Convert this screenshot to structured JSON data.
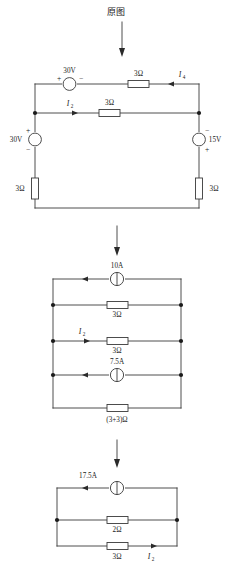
{
  "page": {
    "title": "原图",
    "width": 233,
    "height": 566,
    "background": "#ffffff",
    "ink_color": "#3a3a3a"
  },
  "flow_arrows": [
    {
      "name": "arrow-original-to-step1",
      "from_figure": "original",
      "to_figure": "step1"
    },
    {
      "name": "arrow-step1-to-step2",
      "from_figure": "step1",
      "to_figure": "step2"
    }
  ],
  "figures": [
    {
      "id": "original",
      "caption": "原图",
      "caption_position": "above",
      "components": [
        {
          "name": "source-30v-top",
          "type": "voltage-source",
          "label": "30V",
          "plus": "left",
          "minus": "right",
          "orientation": "horizontal"
        },
        {
          "name": "resistor-3ohm-top-right",
          "type": "resistor",
          "label": "3Ω",
          "orientation": "horizontal"
        },
        {
          "name": "resistor-3ohm-middle",
          "type": "resistor",
          "label": "3Ω",
          "orientation": "horizontal"
        },
        {
          "name": "source-30v-left",
          "type": "voltage-source",
          "label": "30V",
          "plus": "top",
          "minus": "bottom",
          "orientation": "vertical"
        },
        {
          "name": "source-15v-right",
          "type": "voltage-source",
          "label": "15V",
          "plus": "bottom",
          "minus": "top",
          "orientation": "vertical"
        },
        {
          "name": "resistor-3ohm-bottom-left",
          "type": "resistor",
          "label": "3Ω",
          "orientation": "vertical"
        },
        {
          "name": "resistor-3ohm-bottom-right",
          "type": "resistor",
          "label": "3Ω",
          "orientation": "vertical"
        }
      ],
      "currents": [
        {
          "name": "current-I4",
          "symbol": "I",
          "subscript": "4",
          "direction": "left"
        },
        {
          "name": "current-I2",
          "symbol": "I",
          "subscript": "2",
          "direction": "right"
        }
      ]
    },
    {
      "id": "step1",
      "caption": "(3+3)Ω",
      "caption_position": "below",
      "components": [
        {
          "name": "source-10a",
          "type": "current-source",
          "label": "10A",
          "direction": "left",
          "orientation": "horizontal"
        },
        {
          "name": "resistor-3ohm-branch2",
          "type": "resistor",
          "label": "3Ω",
          "orientation": "horizontal"
        },
        {
          "name": "resistor-3ohm-branch3",
          "type": "resistor",
          "label": "3Ω",
          "orientation": "horizontal"
        },
        {
          "name": "source-7p5a",
          "type": "current-source",
          "label": "7.5A",
          "direction": "left",
          "orientation": "horizontal"
        },
        {
          "name": "resistor-3plus3ohm-bottom",
          "type": "resistor",
          "label": "(3+3)Ω",
          "orientation": "horizontal"
        }
      ],
      "currents": [
        {
          "name": "current-I2",
          "symbol": "I",
          "subscript": "2",
          "direction": "right"
        }
      ]
    },
    {
      "id": "step2",
      "caption": "",
      "caption_position": "none",
      "components": [
        {
          "name": "source-17p5a",
          "type": "current-source",
          "label": "17.5A",
          "direction": "left",
          "orientation": "horizontal"
        },
        {
          "name": "resistor-2ohm",
          "type": "resistor",
          "label": "2Ω",
          "orientation": "horizontal"
        },
        {
          "name": "resistor-3ohm-bottom",
          "type": "resistor",
          "label": "3Ω",
          "orientation": "horizontal"
        }
      ],
      "currents": [
        {
          "name": "current-I2",
          "symbol": "I",
          "subscript": "2",
          "direction": "right"
        }
      ]
    }
  ],
  "labels": {
    "title": "原图",
    "v30_top": "30V",
    "v30_left": "30V",
    "v15_right": "15V",
    "r3_top_right": "3Ω",
    "r3_middle": "3Ω",
    "r3_bottom_left": "3Ω",
    "r3_bottom_right": "3Ω",
    "i4": "I",
    "i4_sub": "4",
    "i2_top": "I",
    "i2_top_sub": "2",
    "plus": "+",
    "minus": "−",
    "a10": "10A",
    "r3_b2": "3Ω",
    "r3_b3": "3Ω",
    "a7p5": "7.5A",
    "r33": "(3+3)Ω",
    "i2_mid": "I",
    "i2_mid_sub": "2",
    "a17p5": "17.5A",
    "r2": "2Ω",
    "r3_bot": "3Ω",
    "i2_bot": "I",
    "i2_bot_sub": "2"
  }
}
